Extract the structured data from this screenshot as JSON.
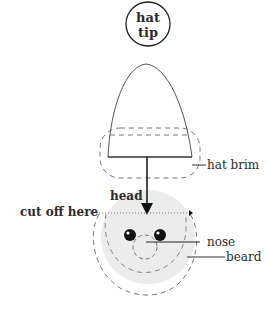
{
  "diagram": {
    "type": "labeled-sketch",
    "labels": {
      "hat_tip_line1": "hat",
      "hat_tip_line2": "tip",
      "hat_brim": "hat brim",
      "head": "head",
      "cut_off": "cut off here",
      "nose": "nose",
      "beard": "beard"
    },
    "colors": {
      "stroke": "#222222",
      "dash_stroke": "#777777",
      "head_fill": "#ececec",
      "eye_fill": "#111111",
      "text": "#2b2b2b"
    }
  }
}
